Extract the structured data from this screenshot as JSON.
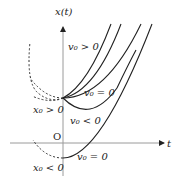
{
  "diagram": {
    "axes": {
      "y_label": "x(t)",
      "x_label": "t",
      "origin_label": "O"
    },
    "labels": {
      "v0_pos": "v₀ > 0",
      "v0_zero_upper": "v₀ = 0",
      "v0_neg": "v₀ < 0",
      "x0_pos": "x₀ > 0",
      "x0_neg": "x₀ < 0",
      "v0_zero_lower": "v₀ = 0"
    },
    "colors": {
      "axis": "#9a9a9a",
      "curve": "#222222",
      "dashed": "#333333",
      "text": "#222222"
    }
  }
}
